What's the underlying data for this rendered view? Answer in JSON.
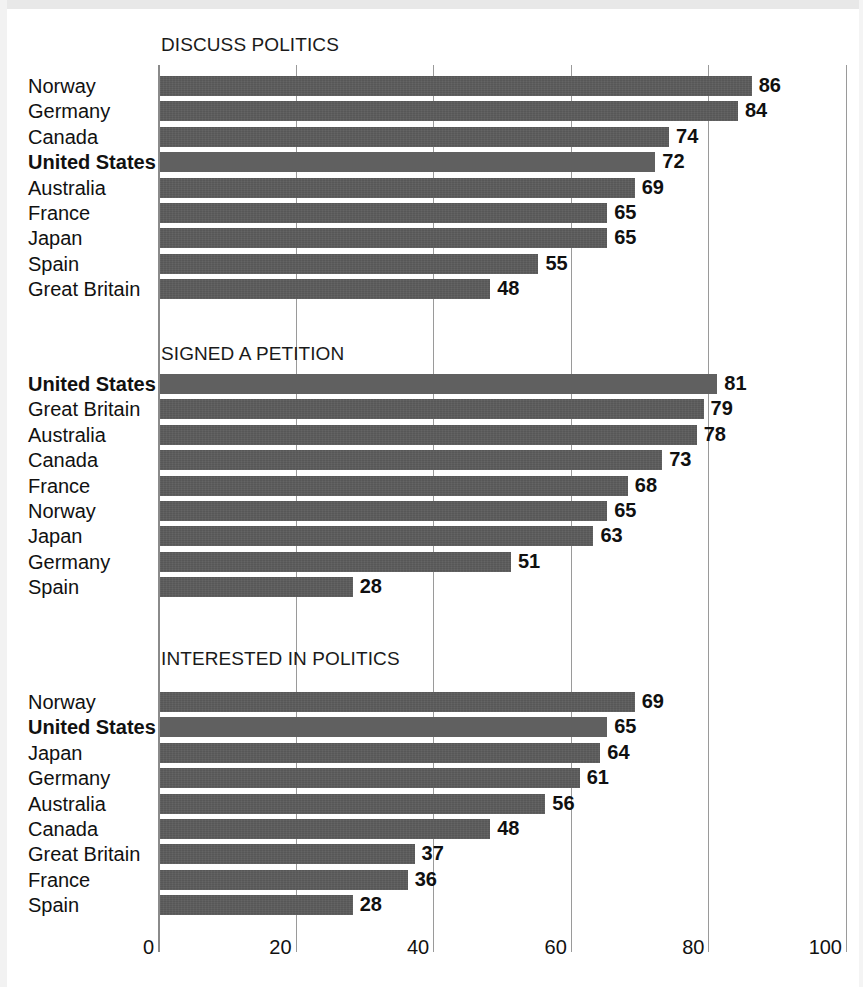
{
  "chart_data": {
    "type": "bar",
    "orientation": "horizontal",
    "title": "",
    "xlabel": "",
    "ylabel": "",
    "xlim": [
      0,
      100
    ],
    "xticks": [
      0,
      20,
      40,
      60,
      80,
      100
    ],
    "xtick_labels": [
      "0",
      "20",
      "40",
      "60",
      "80",
      "100"
    ],
    "grid": true,
    "legend": "none",
    "highlight_category": "United States",
    "colors": {
      "bar": "#575757",
      "bar_highlight": "#606060",
      "gridline": "#9a9a9a",
      "text": "#111111",
      "background": "#ffffff"
    },
    "panels": [
      {
        "title": "DISCUSS POLITICS",
        "categories": [
          "Norway",
          "Germany",
          "Canada",
          "United States",
          "Australia",
          "France",
          "Japan",
          "Spain",
          "Great Britain"
        ],
        "values": [
          86,
          84,
          74,
          72,
          69,
          65,
          65,
          55,
          48
        ]
      },
      {
        "title": "SIGNED A PETITION",
        "categories": [
          "United States",
          "Great Britain",
          "Australia",
          "Canada",
          "France",
          "Norway",
          "Japan",
          "Germany",
          "Spain"
        ],
        "values": [
          81,
          79,
          78,
          73,
          68,
          65,
          63,
          51,
          28
        ]
      },
      {
        "title": "INTERESTED IN POLITICS",
        "categories": [
          "Norway",
          "United States",
          "Japan",
          "Germany",
          "Australia",
          "Canada",
          "Great Britain",
          "France",
          "Spain"
        ],
        "values": [
          69,
          65,
          64,
          61,
          56,
          48,
          37,
          36,
          28
        ]
      }
    ]
  }
}
